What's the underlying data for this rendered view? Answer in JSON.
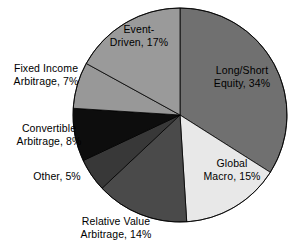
{
  "chart_data": {
    "type": "pie",
    "title": "",
    "subtitle": "",
    "xlabel": "",
    "ylabel": "",
    "legend_position": "none",
    "grid": false,
    "label_format": "{name}, {value}%",
    "start_angle_deg": 0,
    "direction": "clockwise",
    "total": 100,
    "categories": [
      "Long/Short Equity",
      "Global Macro",
      "Relative Value Arbitrage",
      "Other",
      "Convertible Arbitrage",
      "Fixed Income Arbitrage",
      "Event-Driven"
    ],
    "values": [
      34,
      15,
      14,
      5,
      8,
      7,
      17
    ],
    "colors": [
      "#707070",
      "#e8e8e8",
      "#4a4a4a",
      "#383838",
      "#0d0d0d",
      "#989898",
      "#9a9a9a"
    ],
    "slices": [
      {
        "name": "Long/Short Equity",
        "value": 34,
        "label": "Long/Short\nEquity, 34%",
        "color": "#707070",
        "label_placement": "inside"
      },
      {
        "name": "Global Macro",
        "value": 15,
        "label": "Global\nMacro, 15%",
        "color": "#e8e8e8",
        "label_placement": "inside"
      },
      {
        "name": "Relative Value Arbitrage",
        "value": 14,
        "label": "Relative Value\nArbitrage, 14%",
        "color": "#4a4a4a",
        "label_placement": "outside-bottom"
      },
      {
        "name": "Other",
        "value": 5,
        "label": "Other, 5%",
        "color": "#383838",
        "label_placement": "outside-left"
      },
      {
        "name": "Convertible Arbitrage",
        "value": 8,
        "label": "Convertible\nArbitrage, 8%",
        "color": "#0d0d0d",
        "label_placement": "outside-left"
      },
      {
        "name": "Fixed Income Arbitrage",
        "value": 7,
        "label": "Fixed Income\nArbitrage, 7%",
        "color": "#989898",
        "label_placement": "outside-left"
      },
      {
        "name": "Event-Driven",
        "value": 17,
        "label": "Event-\nDriven, 17%",
        "color": "#9a9a9a",
        "label_placement": "inside"
      }
    ],
    "geometry": {
      "center_x": 180,
      "center_y": 115,
      "radius": 107,
      "stroke_color": "#000000",
      "stroke_width": 0.8,
      "background": "#ffffff"
    }
  }
}
